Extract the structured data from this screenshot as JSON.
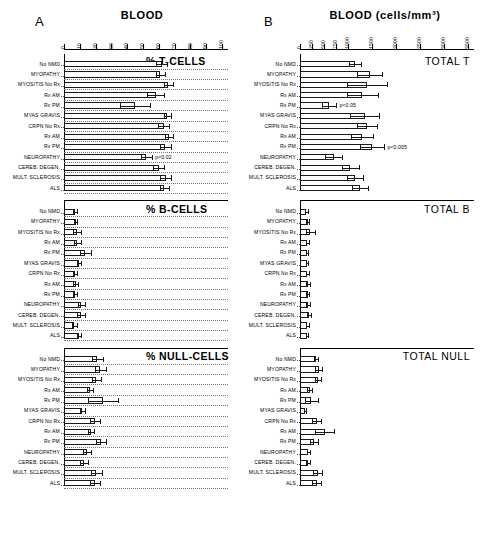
{
  "figure": {
    "panelA": {
      "letter": "A",
      "title": "BLOOD"
    },
    "panelB": {
      "letter": "B",
      "title": "BLOOD (cells/mm³)"
    }
  },
  "row_labels": [
    "No NMD",
    "MYOPATHY",
    "MYOSITIS No Rx",
    "Rx AM",
    "Rx PM",
    "MYAS GRAVIS",
    "CRPN No Rx",
    "Rx AM",
    "Rx PM",
    "NEUROPATHY",
    "CEREB. DEGEN.",
    "MULT. SCLEROSIS",
    "ALS"
  ],
  "chart_data": [
    {
      "type": "bar",
      "title": "% T-CELLS",
      "panel": "A",
      "orientation": "horizontal",
      "xlabel": "BLOOD",
      "ylabel": "",
      "xlim": [
        0,
        100
      ],
      "xticks": [
        0,
        10,
        20,
        30,
        40,
        50,
        60,
        70,
        80,
        90,
        100
      ],
      "grid": true,
      "categories": [
        "No NMD",
        "MYOPATHY",
        "MYOSITIS No Rx",
        "Rx AM",
        "Rx PM",
        "MYAS GRAVIS",
        "CRPN No Rx",
        "Rx AM",
        "Rx PM",
        "NEUROPATHY",
        "CEREB. DEGEN.",
        "MULT. SCLEROSIS",
        "ALS"
      ],
      "values": [
        62.0,
        61.0,
        66.0,
        58.0,
        45.0,
        65.5,
        63.0,
        66.5,
        64.0,
        52.0,
        60.0,
        64.5,
        63.5
      ],
      "errors": [
        3.5,
        3.0,
        3.0,
        5.5,
        9.5,
        2.0,
        3.5,
        2.5,
        3.5,
        3.5,
        3.5,
        3.5,
        3.0
      ],
      "annotations": [
        {
          "category": "NEUROPATHY",
          "text": "p<0.02"
        }
      ]
    },
    {
      "type": "bar",
      "title": "% B-CELLS",
      "panel": "A",
      "orientation": "horizontal",
      "xlim": [
        0,
        100
      ],
      "xticks": [
        0,
        10,
        20,
        30,
        40,
        50,
        60,
        70,
        80,
        90,
        100
      ],
      "grid": true,
      "categories": [
        "No NMD",
        "MYOPATHY",
        "MYOSITIS No Rx",
        "Rx AM",
        "Rx PM",
        "MYAS GRAVIS",
        "CRPN No Rx",
        "Rx AM",
        "Rx PM",
        "NEUROPATHY",
        "CEREB. DEGEN.",
        "MULT. SCLEROSIS",
        "ALS"
      ],
      "values": [
        7.0,
        7.5,
        8.0,
        8.5,
        13.5,
        9.5,
        7.0,
        7.5,
        7.0,
        11.0,
        11.0,
        6.5,
        9.5
      ],
      "errors": [
        1.5,
        1.0,
        2.5,
        2.0,
        3.5,
        1.5,
        1.5,
        1.5,
        1.5,
        2.0,
        2.5,
        1.5,
        1.5
      ]
    },
    {
      "type": "bar",
      "title": "% NULL-CELLS",
      "panel": "A",
      "orientation": "horizontal",
      "xlim": [
        0,
        100
      ],
      "xticks": [
        0,
        10,
        20,
        30,
        40,
        50,
        60,
        70,
        80,
        90,
        100
      ],
      "grid": true,
      "categories": [
        "No NMD",
        "MYOPATHY",
        "MYOSITIS No Rx",
        "Rx AM",
        "Rx PM",
        "MYAS GRAVIS",
        "CRPN No Rx",
        "Rx AM",
        "Rx PM",
        "NEUROPATHY",
        "CEREB. DEGEN.",
        "MULT. SCLEROSIS",
        "ALS"
      ],
      "values": [
        21.0,
        23.0,
        20.5,
        16.5,
        24.5,
        11.5,
        19.5,
        17.0,
        23.5,
        14.5,
        12.5,
        20.5,
        19.5
      ],
      "errors": [
        3.5,
        3.5,
        3.0,
        2.0,
        9.5,
        1.5,
        3.0,
        2.0,
        3.0,
        2.5,
        2.5,
        3.5,
        3.0
      ]
    },
    {
      "type": "bar",
      "title": "TOTAL T",
      "panel": "B",
      "orientation": "horizontal",
      "xlabel": "BLOOD (cells/mm³)",
      "xlim": [
        0,
        3500
      ],
      "xticks": [
        0,
        250,
        500,
        750,
        1000,
        1500,
        2000,
        2500,
        3000,
        3500
      ],
      "scale": "piecewise-compressed",
      "grid": false,
      "categories": [
        "No NMD",
        "MYOPATHY",
        "MYOSITIS No Rx",
        "Rx AM",
        "Rx PM",
        "MYAS GRAVIS",
        "CRPN No Rx",
        "Rx AM",
        "Rx PM",
        "NEUROPATHY",
        "CEREB. DEGEN.",
        "MULT. SCLEROSIS",
        "ALS"
      ],
      "values": [
        1150,
        1450,
        1400,
        1300,
        600,
        1350,
        1400,
        1300,
        1500,
        700,
        1050,
        1150,
        1250
      ],
      "errors": [
        120,
        250,
        420,
        320,
        150,
        300,
        200,
        230,
        250,
        180,
        180,
        170,
        170
      ],
      "annotations": [
        {
          "category": "Rx PM",
          "text": "p<0.05"
        },
        {
          "category": "Rx PM b",
          "text": "p<0.005"
        }
      ]
    },
    {
      "type": "bar",
      "title": "TOTAL B",
      "panel": "B",
      "orientation": "horizontal",
      "xlim": [
        0,
        3500
      ],
      "xticks": [
        0,
        250,
        500,
        750,
        1000,
        1500,
        2000,
        2500,
        3000,
        3500
      ],
      "scale": "piecewise-compressed",
      "grid": false,
      "categories": [
        "No NMD",
        "MYOPATHY",
        "MYOSITIS No Rx",
        "Rx AM",
        "Rx PM",
        "MYAS GRAVIS",
        "CRPN No Rx",
        "Rx AM",
        "Rx PM",
        "NEUROPATHY",
        "CEREB. DEGEN.",
        "MULT. SCLEROSIS",
        "ALS"
      ],
      "values": [
        130,
        160,
        215,
        150,
        145,
        140,
        155,
        170,
        160,
        175,
        195,
        150,
        145
      ],
      "errors": [
        30,
        35,
        90,
        30,
        30,
        25,
        30,
        35,
        30,
        40,
        45,
        35,
        30
      ]
    },
    {
      "type": "bar",
      "title": "TOTAL NULL",
      "panel": "B",
      "orientation": "horizontal",
      "xlim": [
        0,
        3500
      ],
      "xticks": [
        0,
        250,
        500,
        750,
        1000,
        1500,
        2000,
        2500,
        3000,
        3500
      ],
      "scale": "piecewise-compressed",
      "grid": false,
      "categories": [
        "No NMD",
        "MYOPATHY",
        "MYOSITIS No Rx",
        "Rx AM",
        "Rx PM",
        "MYAS GRAVIS",
        "CRPN No Rx",
        "Rx AM",
        "Rx PM",
        "NEUROPATHY",
        "CEREB. DEGEN.",
        "MULT. SCLEROSIS",
        "ALS"
      ],
      "values": [
        330,
        390,
        380,
        200,
        240,
        110,
        350,
        520,
        290,
        175,
        165,
        370,
        350
      ],
      "errors": [
        40,
        70,
        60,
        60,
        130,
        20,
        90,
        200,
        80,
        35,
        35,
        90,
        90
      ]
    }
  ]
}
